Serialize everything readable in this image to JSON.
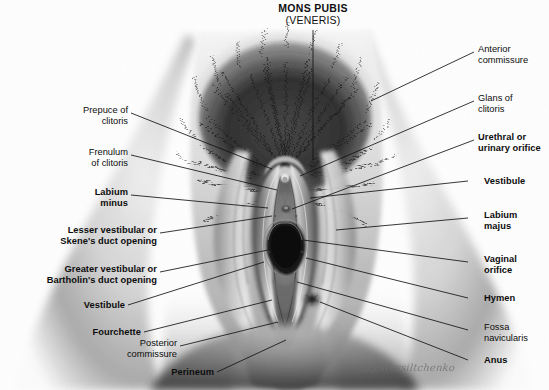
{
  "figure": {
    "title_line1": "MONS PUBIS",
    "title_line2": "(VENERIS)",
    "signature": "G.J.Wassiltchenko",
    "background_color": "#fefefe",
    "ink_color": "#0d0d0d",
    "leader_color": "#1a1a1a",
    "medium": "grayscale pencil illustration"
  },
  "labels_left": [
    {
      "name": "prepuce-of-clitoris",
      "line1": "Prepuce of",
      "line2": "clitoris",
      "weight": "regular"
    },
    {
      "name": "frenulum-of-clitoris",
      "line1": "Frenulum",
      "line2": "of clitoris",
      "weight": "regular"
    },
    {
      "name": "labium-minus",
      "line1": "Labium",
      "line2": "minus",
      "weight": "bold"
    },
    {
      "name": "lesser-vestibular-skenes-duct-opening",
      "line1": "Lesser vestibular or",
      "line2": "Skene's duct opening",
      "weight": "bold"
    },
    {
      "name": "greater-vestibular-bartholins-duct-opening",
      "line1": "Greater vestibular or",
      "line2": "Bartholin's duct opening",
      "weight": "bold"
    },
    {
      "name": "vestibule-left",
      "line1": "Vestibule",
      "line2": "",
      "weight": "bold"
    },
    {
      "name": "fourchette",
      "line1": "Fourchette",
      "line2": "",
      "weight": "bold"
    },
    {
      "name": "posterior-commissure",
      "line1": "Posterior",
      "line2": "commissure",
      "weight": "regular"
    },
    {
      "name": "perineum",
      "line1": "Perineum",
      "line2": "",
      "weight": "bold"
    }
  ],
  "labels_right": [
    {
      "name": "anterior-commissure",
      "line1": "Anterior",
      "line2": "commissure",
      "weight": "regular"
    },
    {
      "name": "glans-of-clitoris",
      "line1": "Glans of",
      "line2": "clitoris",
      "weight": "regular"
    },
    {
      "name": "urethral-or-urinary-orifice",
      "line1": "Urethral or",
      "line2": "urinary orifice",
      "weight": "bold"
    },
    {
      "name": "vestibule-right",
      "line1": "Vestibule",
      "line2": "",
      "weight": "bold"
    },
    {
      "name": "labium-majus",
      "line1": "Labium",
      "line2": "majus",
      "weight": "bold"
    },
    {
      "name": "vaginal-orifice",
      "line1": "Vaginal",
      "line2": "orifice",
      "weight": "bold"
    },
    {
      "name": "hymen",
      "line1": "Hymen",
      "line2": "",
      "weight": "bold"
    },
    {
      "name": "fossa-navicularis",
      "line1": "Fossa",
      "line2": "navicularis",
      "weight": "regular"
    },
    {
      "name": "anus",
      "line1": "Anus",
      "line2": "",
      "weight": "bold"
    }
  ]
}
